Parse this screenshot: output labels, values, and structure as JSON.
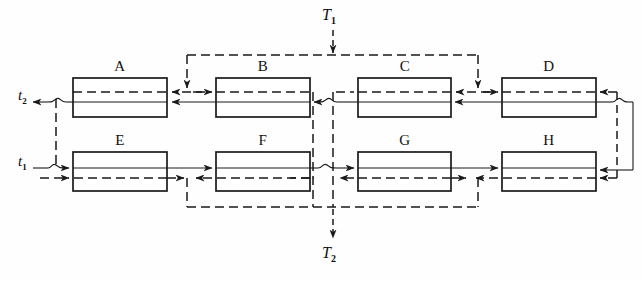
{
  "figure": {
    "type": "block-flow-diagram",
    "background_color": "#fefefe",
    "line_color": "#1a1a1a",
    "boxes": [
      {
        "id": "A",
        "label": "A",
        "row": "top",
        "x": 73,
        "y": 78,
        "w": 94,
        "h": 39
      },
      {
        "id": "B",
        "label": "B",
        "row": "top",
        "x": 216,
        "y": 78,
        "w": 94,
        "h": 39
      },
      {
        "id": "C",
        "label": "C",
        "row": "top",
        "x": 358,
        "y": 78,
        "w": 93,
        "h": 39
      },
      {
        "id": "D",
        "label": "D",
        "row": "top",
        "x": 502,
        "y": 78,
        "w": 94,
        "h": 39
      },
      {
        "id": "E",
        "label": "E",
        "row": "bottom",
        "x": 73,
        "y": 152,
        "w": 94,
        "h": 39
      },
      {
        "id": "F",
        "label": "F",
        "row": "bottom",
        "x": 216,
        "y": 152,
        "w": 94,
        "h": 39
      },
      {
        "id": "G",
        "label": "G",
        "row": "bottom",
        "x": 358,
        "y": 152,
        "w": 93,
        "h": 39
      },
      {
        "id": "H",
        "label": "H",
        "row": "bottom",
        "x": 502,
        "y": 152,
        "w": 94,
        "h": 39
      }
    ],
    "stream_labels": [
      {
        "id": "t1",
        "text": "t",
        "sub": "1",
        "x": 18,
        "y": 158,
        "description": "inlet stream t1 at lower left"
      },
      {
        "id": "t2",
        "text": "t",
        "sub": "2",
        "x": 18,
        "y": 87,
        "description": "outlet stream t2 at upper left"
      }
    ],
    "temperature_labels": [
      {
        "id": "T1",
        "text": "T",
        "sub": "1",
        "x": 322,
        "y": 6,
        "description": "T1 feed entering top dashed header"
      },
      {
        "id": "T2",
        "text": "T",
        "sub": "2",
        "x": 322,
        "y": 244,
        "description": "T2 exiting bottom dashed header"
      }
    ],
    "legend": {
      "solid_line": "process stream (solid line)",
      "dashed_line": "service / heat stream (dashed line)"
    }
  }
}
